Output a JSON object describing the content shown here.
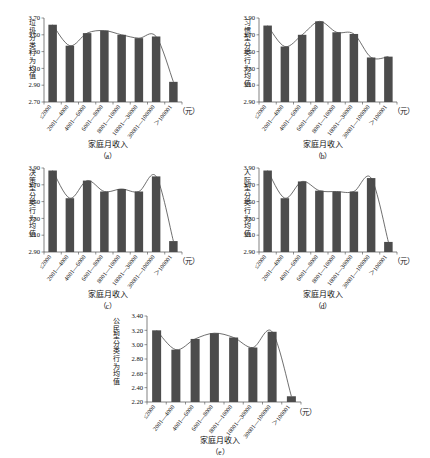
{
  "figure": {
    "background": "#ffffff",
    "bar_color": "#4c4c4c",
    "axis_color": "#4a4a4a",
    "trend_color": "#4a4a4a",
    "categories": [
      "≤2000",
      "2001—4000",
      "4001—6000",
      "6001—8000",
      "8001—10000",
      "10001—30000",
      "30001—100000",
      "＞100001"
    ],
    "xlabel": "家庭月收入",
    "unit": "（元）"
  },
  "chart_data": [
    {
      "id": "a",
      "type": "bar",
      "title": "",
      "caption": "（a）",
      "ylabel": "垃圾分类行为均值",
      "xlabel": "家庭月收入",
      "unit": "（元）",
      "categories": [
        "≤2000",
        "2001—4000",
        "4001—6000",
        "6001—8000",
        "8001—10000",
        "10001—30000",
        "30001—100000",
        "＞100001"
      ],
      "values": [
        3.62,
        3.37,
        3.52,
        3.55,
        3.5,
        3.46,
        3.48,
        2.94
      ],
      "ylim": [
        2.7,
        3.7
      ],
      "yticks": [
        "3.70",
        "3.50",
        "3.30",
        "3.10",
        "2.90",
        "2.70"
      ],
      "grid": false,
      "legend": "none",
      "series": [
        {
          "name": "垃圾分类行为均值",
          "values": [
            3.62,
            3.37,
            3.52,
            3.55,
            3.5,
            3.46,
            3.48,
            2.94
          ]
        }
      ],
      "trend": "smooth-curve-over-bars"
    },
    {
      "id": "b",
      "type": "bar",
      "title": "",
      "caption": "（b）",
      "ylabel": "习惯型分类行为均值",
      "xlabel": "家庭月收入",
      "unit": "（元）",
      "categories": [
        "≤2000",
        "2001—4000",
        "4001—6000",
        "6001—8000",
        "8001—10000",
        "10001—30000",
        "30001—100000",
        "＞100001"
      ],
      "values": [
        3.81,
        3.56,
        3.7,
        3.86,
        3.73,
        3.71,
        3.43,
        3.44
      ],
      "ylim": [
        2.9,
        3.9
      ],
      "yticks": [
        "3.90",
        "3.70",
        "3.50",
        "3.30",
        "3.10",
        "2.90"
      ],
      "grid": false,
      "legend": "none",
      "series": [
        {
          "name": "习惯型分类行为均值",
          "values": [
            3.81,
            3.56,
            3.7,
            3.86,
            3.73,
            3.71,
            3.43,
            3.44
          ]
        }
      ],
      "trend": "smooth-curve-over-bars"
    },
    {
      "id": "c",
      "type": "bar",
      "title": "",
      "caption": "（c）",
      "ylabel": "决策型分类行为均值",
      "xlabel": "家庭月收入",
      "unit": "（元）",
      "categories": [
        "≤2000",
        "2001—4000",
        "4001—6000",
        "6001—8000",
        "8001—10000",
        "10001—30000",
        "30001—100000",
        "＞100001"
      ],
      "values": [
        3.87,
        3.54,
        3.75,
        3.62,
        3.65,
        3.62,
        3.8,
        3.03
      ],
      "ylim": [
        2.9,
        3.9
      ],
      "yticks": [
        "3.90",
        "3.70",
        "3.50",
        "3.30",
        "3.10",
        "2.90"
      ],
      "grid": false,
      "legend": "none",
      "series": [
        {
          "name": "决策型分类行为均值",
          "values": [
            3.87,
            3.54,
            3.75,
            3.62,
            3.65,
            3.62,
            3.8,
            3.03
          ]
        }
      ],
      "trend": "smooth-curve-over-bars"
    },
    {
      "id": "d",
      "type": "bar",
      "title": "",
      "caption": "（d）",
      "ylabel": "人际型分类行为均值",
      "xlabel": "家庭月收入",
      "unit": "（元）",
      "categories": [
        "≤2000",
        "2001—4000",
        "4001—6000",
        "6001—8000",
        "8001—10000",
        "10001—30000",
        "30001—100000",
        "＞100001"
      ],
      "values": [
        3.87,
        3.54,
        3.74,
        3.63,
        3.62,
        3.62,
        3.78,
        3.02
      ],
      "ylim": [
        2.9,
        3.9
      ],
      "yticks": [
        "3.90",
        "3.70",
        "3.50",
        "3.30",
        "3.10",
        "2.90"
      ],
      "grid": false,
      "legend": "none",
      "series": [
        {
          "name": "人际型分类行为均值",
          "values": [
            3.87,
            3.54,
            3.74,
            3.63,
            3.62,
            3.62,
            3.78,
            3.02
          ]
        }
      ],
      "trend": "smooth-curve-over-bars"
    },
    {
      "id": "e",
      "type": "bar",
      "title": "",
      "caption": "（e）",
      "ylabel": "公民型分类行为均值",
      "xlabel": "家庭月收入",
      "unit": "（元）",
      "categories": [
        "≤2000",
        "2001—4000",
        "4001—6000",
        "6001—8000",
        "8001—10000",
        "10001—30000",
        "30001—100000",
        "＞100001"
      ],
      "values": [
        3.2,
        2.93,
        3.08,
        3.16,
        3.1,
        2.96,
        3.18,
        2.28
      ],
      "ylim": [
        2.2,
        3.4
      ],
      "yticks": [
        "3.40",
        "3.20",
        "3.00",
        "2.80",
        "2.60",
        "2.40",
        "2.20"
      ],
      "grid": false,
      "legend": "none",
      "series": [
        {
          "name": "公民型分类行为均值",
          "values": [
            3.2,
            2.93,
            3.08,
            3.16,
            3.1,
            2.96,
            3.18,
            2.28
          ]
        }
      ],
      "trend": "smooth-curve-over-bars"
    }
  ]
}
